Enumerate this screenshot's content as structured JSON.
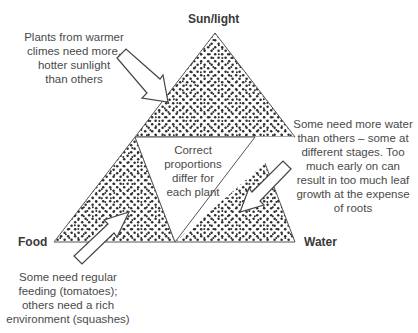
{
  "diagram": {
    "vertices": {
      "top": "Sun/light",
      "left": "Food",
      "right": "Water"
    },
    "center_text": "Correct\nproportions\ndiffer for\neach plant",
    "annotations": {
      "sunlight": "Plants from warmer\nclimes need more,\nhotter sunlight\nthan others",
      "water": "Some need more water\nthan others – some at\ndifferent stages. Too\nmuch early on can\nresult in too much leaf\ngrowth at the expense\nof roots",
      "food": "Some need regular\nfeeding (tomatoes);\nothers need a rich\nenvironment (squashes)"
    },
    "colors": {
      "fill_dots": "#2e2e2e",
      "outline": "#555555",
      "text": "#444444"
    }
  }
}
